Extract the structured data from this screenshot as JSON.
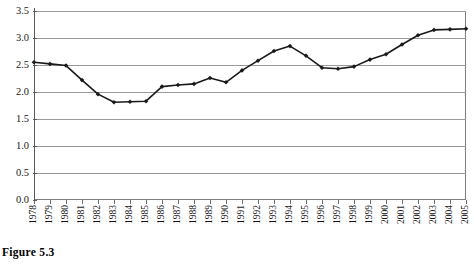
{
  "caption": "Figure 5.3",
  "chart_data": {
    "type": "line",
    "title": "",
    "xlabel": "",
    "ylabel": "",
    "grid": true,
    "legend": "none",
    "marker": "diamond",
    "line_color": "#1a1a1a",
    "grid_color": "#9a9a9a",
    "axis_color": "#5a5a5a",
    "ylim": [
      0.0,
      3.5
    ],
    "ytick_labels": [
      "0.0",
      "0.5",
      "1.0",
      "1.5",
      "2.0",
      "2.5",
      "3.0",
      "3.5"
    ],
    "ytick_values": [
      0.0,
      0.5,
      1.0,
      1.5,
      2.0,
      2.5,
      3.0,
      3.5
    ],
    "categories": [
      "1978",
      "1979",
      "1980",
      "1981",
      "1982",
      "1983",
      "1984",
      "1985",
      "1986",
      "1987",
      "1988",
      "1989",
      "1990",
      "1991",
      "1992",
      "1993",
      "1994",
      "1995",
      "1996",
      "1997",
      "1998",
      "1999",
      "2000",
      "2001",
      "2002",
      "2003",
      "2004",
      "2005"
    ],
    "values": [
      2.55,
      2.52,
      2.49,
      2.22,
      1.96,
      1.81,
      1.82,
      1.83,
      2.1,
      2.13,
      2.15,
      2.26,
      2.18,
      2.4,
      2.58,
      2.76,
      2.85,
      2.67,
      2.45,
      2.43,
      2.47,
      2.6,
      2.7,
      2.88,
      3.05,
      3.15,
      3.16,
      3.17
    ]
  }
}
